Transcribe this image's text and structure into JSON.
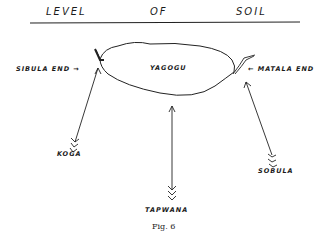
{
  "header": {
    "words": [
      "LEVEL",
      "OF",
      "SOIL"
    ]
  },
  "tuber": {
    "label": "YAGOGU"
  },
  "ends": {
    "left": "SIBULA END →",
    "right": "← MATALA END"
  },
  "arrows": [
    {
      "label": "KOGA"
    },
    {
      "label": "TAPWANA"
    },
    {
      "label": "SOBULA"
    }
  ],
  "caption": "Fig. 6"
}
